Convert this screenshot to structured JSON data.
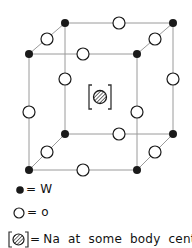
{
  "diagram": {
    "title": "",
    "colors": {
      "edge": "#9a9a9a",
      "tungsten": "#1a1a1a",
      "oxygen_fill": "#ffffff",
      "oxygen_stroke": "#1a1a1a",
      "sodium_hatch": "#333333"
    },
    "vertices": [
      {
        "id": "back-top-left",
        "x": 65,
        "y": 23,
        "species": "W"
      },
      {
        "id": "back-top-right",
        "x": 173,
        "y": 23,
        "species": "W"
      },
      {
        "id": "front-top-left",
        "x": 29,
        "y": 54,
        "species": "W"
      },
      {
        "id": "front-top-right",
        "x": 137,
        "y": 54,
        "species": "W"
      },
      {
        "id": "back-bottom-left",
        "x": 65,
        "y": 134,
        "species": "W"
      },
      {
        "id": "back-bottom-right",
        "x": 173,
        "y": 134,
        "species": "W"
      },
      {
        "id": "front-bottom-left",
        "x": 29,
        "y": 170,
        "species": "W"
      },
      {
        "id": "front-bottom-right",
        "x": 137,
        "y": 170,
        "species": "W"
      }
    ],
    "edge_midpoints_species": "O",
    "body_centre": {
      "x": 100,
      "y": 97,
      "species": "Na",
      "bracketed": true
    }
  },
  "legend": {
    "items": [
      {
        "symbol": "filled-circle",
        "equals": "=",
        "label": "W"
      },
      {
        "symbol": "open-circle",
        "equals": "=",
        "label": "o"
      },
      {
        "symbol": "bracketed-hatched-circle",
        "equals": "=",
        "label": "Na  at  some  body  centres"
      }
    ]
  }
}
